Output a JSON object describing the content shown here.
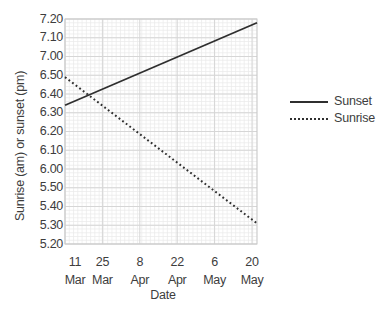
{
  "chart_data": {
    "type": "line",
    "title": "",
    "xlabel": "Date",
    "ylabel": "Sunrise (am) or sunset (pm)",
    "x_categories": [
      "11 Mar",
      "25 Mar",
      "8 Apr",
      "22 Apr",
      "6 May",
      "20 May"
    ],
    "x_tick_labels": [
      {
        "day": "11",
        "month": "Mar"
      },
      {
        "day": "25",
        "month": "Mar"
      },
      {
        "day": "8",
        "month": "Apr"
      },
      {
        "day": "22",
        "month": "Apr"
      },
      {
        "day": "6",
        "month": "May"
      },
      {
        "day": "20",
        "month": "May"
      }
    ],
    "y_tick_labels": [
      "7.20",
      "7.10",
      "7.00",
      "6.50",
      "6.40",
      "6.30",
      "6.20",
      "6.10",
      "6.00",
      "5.50",
      "5.40",
      "5.30",
      "5.20"
    ],
    "y_axis_format": "time of day in h.mm, 10-minute steps",
    "ylim": [
      "5.20",
      "7.20"
    ],
    "series": [
      {
        "name": "Sunset",
        "line_style": "solid",
        "values_at_ticks": [
          "6.34",
          "6.43",
          "6.51",
          "7.00",
          "7.08",
          "7.17"
        ],
        "edge_values": [
          "6.34",
          "7.18"
        ]
      },
      {
        "name": "Sunrise",
        "line_style": "dotted",
        "values_at_ticks": [
          "6.49",
          "6.34",
          "6.19",
          "6.03",
          "5.48",
          "5.33"
        ],
        "edge_values": [
          "6.49",
          "5.31"
        ]
      }
    ],
    "legend_position": "right",
    "grid": "fine minor mesh with darker major lines at each tick",
    "colors": {
      "line": "#2f2f2f",
      "minor_grid": "#e9e9e9",
      "major_grid": "#d6d6d6",
      "plot_border": "#c9c9c9",
      "text": "#3d3d3d",
      "background": "#ffffff"
    }
  }
}
